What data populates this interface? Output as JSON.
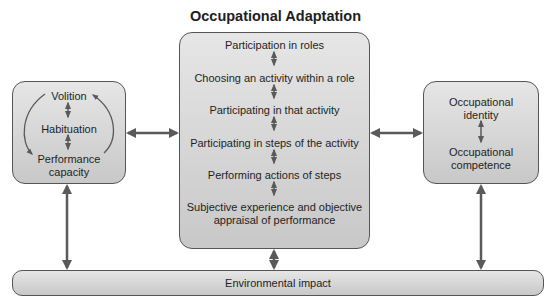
{
  "diagram": {
    "title": "Occupational Adaptation",
    "left_box": {
      "items": [
        "Volition",
        "Habituation",
        "Performance",
        "capacity"
      ]
    },
    "center_box": {
      "items": [
        "Participation in roles",
        "Choosing an activity within a role",
        "Participating in that activity",
        "Participating in steps of the activity",
        "Performing actions of steps",
        "Subjective experience and objective",
        "appraisal of performance"
      ]
    },
    "right_box": {
      "items": [
        "Occupational",
        "identity",
        "Occupational",
        "competence"
      ]
    },
    "bottom_bar": {
      "label": "Environmental impact"
    },
    "colors": {
      "box_fill_top": "#e6e6e6",
      "box_fill_bottom": "#c8c8c8",
      "border": "#555555",
      "arrow": "#5a5a5a"
    }
  }
}
